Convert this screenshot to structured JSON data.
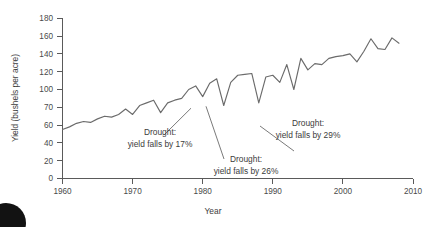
{
  "figure": {
    "background_color": "#ffffff",
    "line_color": "#6b6b6b",
    "axis_color": "#5a5a5a",
    "text_color": "#3c3c3c",
    "corner_mark": "page-edge-blob"
  },
  "chart_data": {
    "type": "line",
    "title": "",
    "xlabel": "Year",
    "ylabel": "Yield (bushels per acre)",
    "xlim": [
      1960,
      2010
    ],
    "ylim": [
      0,
      180
    ],
    "grid": false,
    "legend": null,
    "xticks": [
      1960,
      1970,
      1980,
      1990,
      2000,
      2010
    ],
    "xtick_labels": [
      "1960",
      "1970",
      "1980",
      "1990",
      "2000",
      "2010"
    ],
    "yticks": [
      0,
      20,
      40,
      60,
      70,
      100,
      120,
      140,
      160,
      180
    ],
    "ytick_labels": [
      "0",
      "20",
      "40",
      "60",
      "70",
      "100",
      "120",
      "140",
      "160",
      "180"
    ],
    "series": [
      {
        "name": "Corn yield",
        "x": [
          1960,
          1961,
          1962,
          1963,
          1964,
          1965,
          1966,
          1967,
          1968,
          1969,
          1970,
          1971,
          1972,
          1973,
          1974,
          1975,
          1976,
          1977,
          1978,
          1979,
          1980,
          1981,
          1982,
          1983,
          1984,
          1985,
          1986,
          1987,
          1988,
          1989,
          1990,
          1991,
          1992,
          1993,
          1994,
          1995,
          1996,
          1997,
          1998,
          1999,
          2000,
          2001,
          2002,
          2003,
          2004,
          2005,
          2006,
          2007,
          2008
        ],
        "values": [
          55,
          58,
          62,
          64,
          63,
          67,
          70,
          69,
          72,
          78,
          72,
          82,
          85,
          88,
          74,
          85,
          88,
          90,
          100,
          104,
          92,
          107,
          112,
          82,
          108,
          116,
          117,
          118,
          85,
          114,
          116,
          108,
          128,
          100,
          135,
          122,
          129,
          128,
          135,
          137,
          138,
          140,
          131,
          143,
          157,
          146,
          145,
          158,
          152
        ]
      }
    ],
    "annotations": [
      {
        "id": "drought-1974",
        "line1": "Drought:",
        "line2": "yield falls by 17%",
        "target_x": 1974,
        "target_y": 74
      },
      {
        "id": "drought-1983",
        "line1": "Drought:",
        "line2": "yield falls by 26%",
        "target_x": 1983,
        "target_y": 82
      },
      {
        "id": "drought-1993",
        "line1": "Drought:",
        "line2": "yield falls by 29%",
        "target_x": 1993,
        "target_y": 100
      }
    ]
  }
}
